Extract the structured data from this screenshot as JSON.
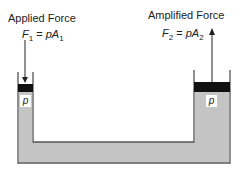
{
  "diagram": {
    "left": {
      "label": "Applied Force",
      "equation": {
        "lhs": "F",
        "lhs_sub": "1",
        "op": " = ",
        "rhs": "pA",
        "rhs_sub": "1"
      },
      "pressure_label": "p",
      "arrow": "down"
    },
    "right": {
      "label": "Amplified Force",
      "equation": {
        "lhs": "F",
        "lhs_sub": "2",
        "op": " = ",
        "rhs": "pA",
        "rhs_sub": "2"
      },
      "pressure_label": "p",
      "arrow": "up"
    },
    "colors": {
      "fluid": "#c4c4c4",
      "piston": "#111111",
      "wall": "#555555"
    }
  }
}
